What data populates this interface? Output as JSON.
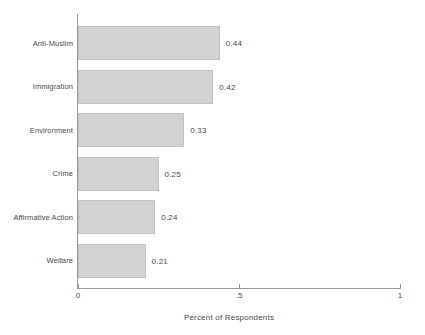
{
  "chart_data": {
    "type": "bar",
    "orientation": "horizontal",
    "title": "",
    "xlabel": "Percent of Respondents",
    "ylabel": "",
    "xlim": [
      0,
      1
    ],
    "xticks": [
      0,
      0.5,
      1
    ],
    "xtick_labels": [
      "0",
      ".5",
      "1"
    ],
    "grid": false,
    "legend": null,
    "categories": [
      "Anti-Muslim",
      "Immigration",
      "Environment",
      "Crime",
      "Affirmative Action",
      "Welfare"
    ],
    "values": [
      0.44,
      0.42,
      0.33,
      0.25,
      0.24,
      0.21
    ],
    "value_labels": [
      "0.44",
      "0.42",
      "0.33",
      "0.25",
      "0.24",
      "0.21"
    ],
    "bar_fill_color": "#d2d2d2",
    "bar_border_color": "#c2c2c2",
    "axis_color": "#9a9a9a",
    "text_color": "#4a4a4a",
    "background_color": "#ffffff"
  }
}
